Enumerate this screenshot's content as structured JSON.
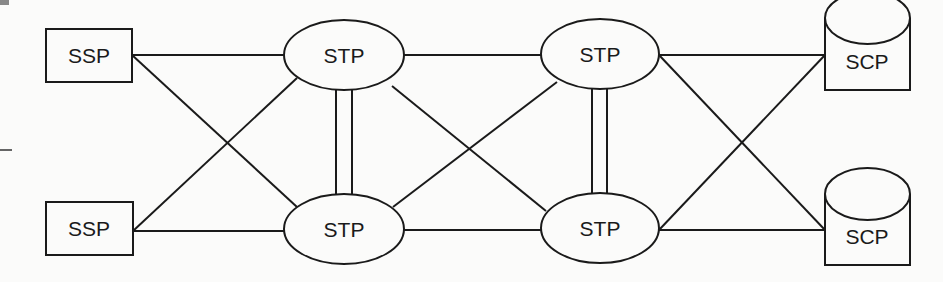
{
  "diagram": {
    "type": "ss7-signaling-network",
    "colors": {
      "line": "#1a1a1a",
      "background": "#fbfbfa",
      "artifact": "#888888"
    },
    "nodes": [
      {
        "id": "ssp_top",
        "kind": "SSP",
        "shape": "rectangle",
        "label": "SSP"
      },
      {
        "id": "ssp_bottom",
        "kind": "SSP",
        "shape": "rectangle",
        "label": "SSP"
      },
      {
        "id": "stp_a_top",
        "kind": "STP",
        "shape": "ellipse",
        "label": "STP"
      },
      {
        "id": "stp_a_bottom",
        "kind": "STP",
        "shape": "ellipse",
        "label": "STP"
      },
      {
        "id": "stp_b_top",
        "kind": "STP",
        "shape": "ellipse",
        "label": "STP"
      },
      {
        "id": "stp_b_bottom",
        "kind": "STP",
        "shape": "ellipse",
        "label": "STP"
      },
      {
        "id": "scp_top",
        "kind": "SCP",
        "shape": "cylinder",
        "label": "SCP"
      },
      {
        "id": "scp_bottom",
        "kind": "SCP",
        "shape": "cylinder",
        "label": "SCP"
      }
    ],
    "links": [
      {
        "from": "ssp_top",
        "to": "stp_a_top",
        "style": "single"
      },
      {
        "from": "ssp_top",
        "to": "stp_a_bottom",
        "style": "single"
      },
      {
        "from": "ssp_bottom",
        "to": "stp_a_bottom",
        "style": "single"
      },
      {
        "from": "ssp_bottom",
        "to": "stp_a_top",
        "style": "single"
      },
      {
        "from": "stp_a_top",
        "to": "stp_a_bottom",
        "style": "double"
      },
      {
        "from": "stp_a_top",
        "to": "stp_b_top",
        "style": "single"
      },
      {
        "from": "stp_a_top",
        "to": "stp_b_bottom",
        "style": "single"
      },
      {
        "from": "stp_a_bottom",
        "to": "stp_b_bottom",
        "style": "single"
      },
      {
        "from": "stp_a_bottom",
        "to": "stp_b_top",
        "style": "single"
      },
      {
        "from": "stp_b_top",
        "to": "stp_b_bottom",
        "style": "double"
      },
      {
        "from": "stp_b_top",
        "to": "scp_top",
        "style": "single"
      },
      {
        "from": "stp_b_top",
        "to": "scp_bottom",
        "style": "single"
      },
      {
        "from": "stp_b_bottom",
        "to": "scp_bottom",
        "style": "single"
      },
      {
        "from": "stp_b_bottom",
        "to": "scp_top",
        "style": "single"
      }
    ]
  },
  "labels": {
    "ssp_top": "SSP",
    "ssp_bottom": "SSP",
    "stp_a_top": "STP",
    "stp_a_bottom": "STP",
    "stp_b_top": "STP",
    "stp_b_bottom": "STP",
    "scp_top": "SCP",
    "scp_bottom": "SCP"
  }
}
